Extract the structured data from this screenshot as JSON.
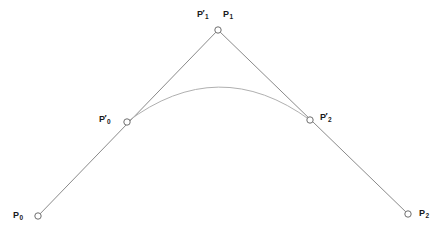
{
  "figure": {
    "kind": "geometric-diagram",
    "canvas": {
      "width": 444,
      "height": 242,
      "background": "#ffffff"
    },
    "colors": {
      "polyline": "#8a8a8a",
      "curve": "#b0b0b0",
      "marker_stroke": "#6e6e6e",
      "marker_fill": "#ffffff",
      "label_text": "#1a1a1a"
    }
  },
  "points": [
    {
      "id": "p0",
      "name": "P0",
      "base": "P",
      "prime": "",
      "subscript": "0",
      "x": 38,
      "y": 216,
      "label_x": 13,
      "label_y": 211,
      "label_side": "left"
    },
    {
      "id": "p0-prime",
      "name": "P'0",
      "base": "P",
      "prime": "′",
      "subscript": "0",
      "x": 127,
      "y": 122,
      "label_x": 99,
      "label_y": 115,
      "label_side": "left"
    },
    {
      "id": "p1-prime",
      "name": "P'1",
      "base": "P",
      "prime": "′",
      "subscript": "1",
      "x": 218,
      "y": 30,
      "label_x": 197,
      "label_y": 10,
      "label_side": "above-left"
    },
    {
      "id": "p1",
      "name": "P1",
      "base": "P",
      "prime": "",
      "subscript": "1",
      "x": 218,
      "y": 30,
      "label_x": 223,
      "label_y": 10,
      "label_side": "above-right"
    },
    {
      "id": "p2-prime",
      "name": "P'2",
      "base": "P",
      "prime": "′",
      "subscript": "2",
      "x": 310,
      "y": 120,
      "label_x": 320,
      "label_y": 113,
      "label_side": "right"
    },
    {
      "id": "p2",
      "name": "P2",
      "base": "P",
      "prime": "",
      "subscript": "2",
      "x": 408,
      "y": 214,
      "label_x": 419,
      "label_y": 209,
      "label_side": "right"
    }
  ],
  "markers": {
    "radius": 3.2,
    "stroke_width": 1,
    "at": [
      "p0",
      "p0-prime",
      "p1-prime",
      "p2-prime",
      "p2"
    ]
  },
  "chart_data": {
    "type": "line",
    "title": "",
    "xlabel": "",
    "ylabel": "",
    "xlim": [
      0,
      444
    ],
    "ylim": [
      242,
      0
    ],
    "grid": false,
    "legend": "none",
    "annotations": [
      "P0",
      "P'0",
      "P'1",
      "P1",
      "P'2",
      "P2"
    ],
    "series": [
      {
        "name": "control-polygon",
        "kind": "polyline",
        "color": "#8a8a8a",
        "width": 1,
        "x": [
          38,
          218,
          408
        ],
        "y": [
          216,
          30,
          214
        ]
      },
      {
        "name": "bezier-curve",
        "kind": "quadratic-bezier",
        "color": "#b0b0b0",
        "width": 1,
        "start": [
          127,
          122
        ],
        "control": [
          218,
          53
        ],
        "end": [
          310,
          120
        ],
        "apex": [
          218,
          76
        ]
      }
    ]
  },
  "paths": {
    "polyline": "M 38 216 L 218 30 L 408 214",
    "curve": "M 127 122 Q 218.5 53 310 120"
  }
}
